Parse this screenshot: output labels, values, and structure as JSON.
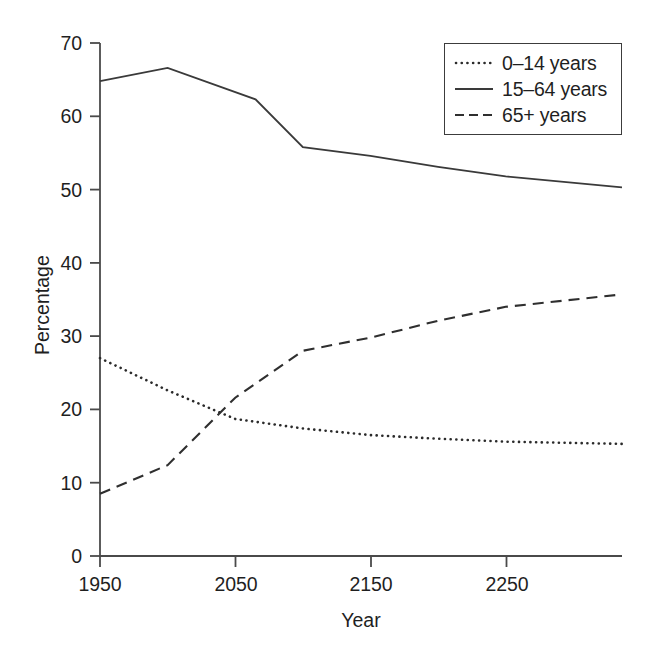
{
  "chart_data": {
    "type": "line",
    "title": "",
    "xlabel": "Year",
    "ylabel": "Percentage",
    "xlim": [
      1950,
      2336
    ],
    "ylim": [
      0,
      70
    ],
    "xticks": [
      1950,
      2050,
      2150,
      2250
    ],
    "yticks": [
      0,
      10,
      20,
      30,
      40,
      50,
      60,
      70
    ],
    "grid": false,
    "legend_position": "top-right",
    "series": [
      {
        "name": "0–14 years",
        "style": "dotted",
        "color": "#2b2b2b",
        "x": [
          1950,
          2000,
          2050,
          2100,
          2150,
          2200,
          2250,
          2336
        ],
        "values": [
          27.0,
          22.6,
          18.7,
          17.4,
          16.5,
          16.0,
          15.6,
          15.3
        ]
      },
      {
        "name": "15–64 years",
        "style": "solid",
        "color": "#3a3a3a",
        "x": [
          1950,
          2000,
          2065,
          2100,
          2150,
          2200,
          2250,
          2336
        ],
        "values": [
          64.8,
          66.6,
          62.3,
          55.8,
          54.6,
          53.1,
          51.8,
          50.3
        ]
      },
      {
        "name": "65+ years",
        "style": "dashed",
        "color": "#2f2f2f",
        "x": [
          1950,
          2000,
          2050,
          2100,
          2150,
          2200,
          2250,
          2336
        ],
        "values": [
          8.5,
          12.4,
          21.6,
          28.0,
          29.8,
          32.1,
          34.0,
          35.7
        ]
      }
    ]
  },
  "axes": {
    "ytick_labels": [
      "70",
      "60",
      "50",
      "40",
      "30",
      "20",
      "10",
      "0"
    ],
    "xtick_labels": [
      "1950",
      "2050",
      "2150",
      "2250"
    ],
    "y_axis_title": "Percentage",
    "x_axis_title": "Year"
  },
  "legend": {
    "entries": [
      {
        "label": "0–14 years",
        "swatch": "dotted-line-swatch"
      },
      {
        "label": "15–64 years",
        "swatch": "solid-line-swatch"
      },
      {
        "label": "65+ years",
        "swatch": "dashed-line-swatch"
      }
    ]
  }
}
